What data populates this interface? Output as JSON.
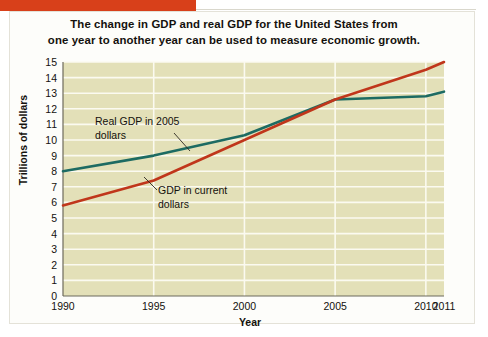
{
  "caption": {
    "line1": "The change in GDP and real GDP for the United States from",
    "line2": "one year to another year can be used to measure economic growth."
  },
  "colors": {
    "accent_bar": "#d8401a",
    "plot_background": "#e3e0b8",
    "gridline": "#fbfaf0",
    "series_real_gdp": "#1d6b62",
    "series_current_gdp": "#c0361b",
    "text": "#14110d",
    "card_background": "#fdfdfa"
  },
  "chart_data": {
    "type": "line",
    "title": "",
    "xlabel": "Year",
    "ylabel": "Trillions of dollars",
    "x": [
      1990,
      1995,
      2000,
      2005,
      2010,
      2011
    ],
    "xtick_labels": [
      "1990",
      "1995",
      "2000",
      "2005",
      "2010",
      "2011"
    ],
    "ytick_labels": [
      "15",
      "14",
      "13",
      "12",
      "11",
      "10",
      "9",
      "8",
      "7",
      "6",
      "5",
      "4",
      "3",
      "2",
      "1",
      "0"
    ],
    "xlim": [
      1990,
      2011
    ],
    "ylim": [
      0,
      15
    ],
    "grid": true,
    "legend": "annotations",
    "series": [
      {
        "name": "Real GDP in 2005 dollars",
        "color": "#1d6b62",
        "values": [
          8.0,
          9.0,
          10.3,
          12.6,
          12.8,
          13.1
        ]
      },
      {
        "name": "GDP in current dollars",
        "color": "#c0361b",
        "values": [
          5.8,
          7.4,
          10.0,
          12.6,
          14.5,
          15.0
        ]
      }
    ],
    "annotations": [
      {
        "id": "real-gdp",
        "line1": "Real GDP in 2005",
        "line2": "dollars"
      },
      {
        "id": "current-gdp",
        "line1": "GDP in current",
        "line2": "dollars"
      }
    ]
  }
}
